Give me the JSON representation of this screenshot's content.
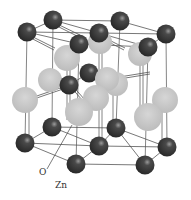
{
  "diagram": {
    "labels": {
      "oxygen": "O",
      "zinc": "Zn"
    },
    "colors": {
      "zinc": "#3c3c3c",
      "zinc_highlight": "#8a8a8a",
      "oxygen": "#c4c4c4",
      "oxygen_highlight": "#dcdcdc",
      "bond": "#555555",
      "background": "#ffffff"
    },
    "atoms": {
      "zinc": [
        {
          "x": 27,
          "y": 32
        },
        {
          "x": 53,
          "y": 20
        },
        {
          "x": 99,
          "y": 33
        },
        {
          "x": 120,
          "y": 21
        },
        {
          "x": 166,
          "y": 34
        },
        {
          "x": 79,
          "y": 44
        },
        {
          "x": 148,
          "y": 47
        },
        {
          "x": 89,
          "y": 73
        },
        {
          "x": 69,
          "y": 85
        },
        {
          "x": 25,
          "y": 143
        },
        {
          "x": 52,
          "y": 127
        },
        {
          "x": 99,
          "y": 146
        },
        {
          "x": 116,
          "y": 128
        },
        {
          "x": 167,
          "y": 147
        },
        {
          "x": 76,
          "y": 164
        },
        {
          "x": 145,
          "y": 165
        }
      ],
      "oxygen": [
        {
          "x": 67,
          "y": 58
        },
        {
          "x": 140,
          "y": 54
        },
        {
          "x": 100,
          "y": 42
        },
        {
          "x": 25,
          "y": 100
        },
        {
          "x": 50,
          "y": 80
        },
        {
          "x": 107,
          "y": 79
        },
        {
          "x": 83,
          "y": 101
        },
        {
          "x": 165,
          "y": 100
        },
        {
          "x": 116,
          "y": 84
        },
        {
          "x": 96,
          "y": 98
        },
        {
          "x": 75,
          "y": 116
        },
        {
          "x": 148,
          "y": 117
        }
      ]
    }
  }
}
